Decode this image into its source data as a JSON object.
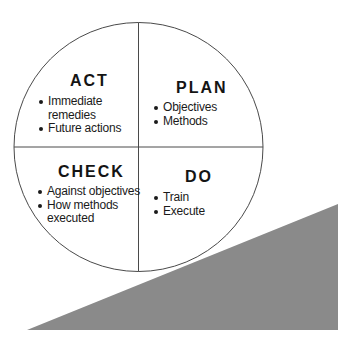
{
  "diagram": {
    "type": "PDCA cycle",
    "colors": {
      "circle_stroke": "#4a4a4a",
      "divider_stroke": "#4a4a4a",
      "wedge_fill": "#8a8a8a",
      "text": "#141414",
      "background": "#ffffff"
    },
    "quadrants": {
      "act": {
        "title": "ACT",
        "items": [
          "Immediate",
          "remedies",
          "Future actions"
        ]
      },
      "plan": {
        "title": "PLAN",
        "items": [
          "Objectives",
          "Methods"
        ]
      },
      "check": {
        "title": "CHECK",
        "items": [
          "Against objectives",
          "How methods",
          "executed"
        ]
      },
      "do": {
        "title": "DO",
        "items": [
          "Train",
          "Execute"
        ]
      }
    }
  }
}
